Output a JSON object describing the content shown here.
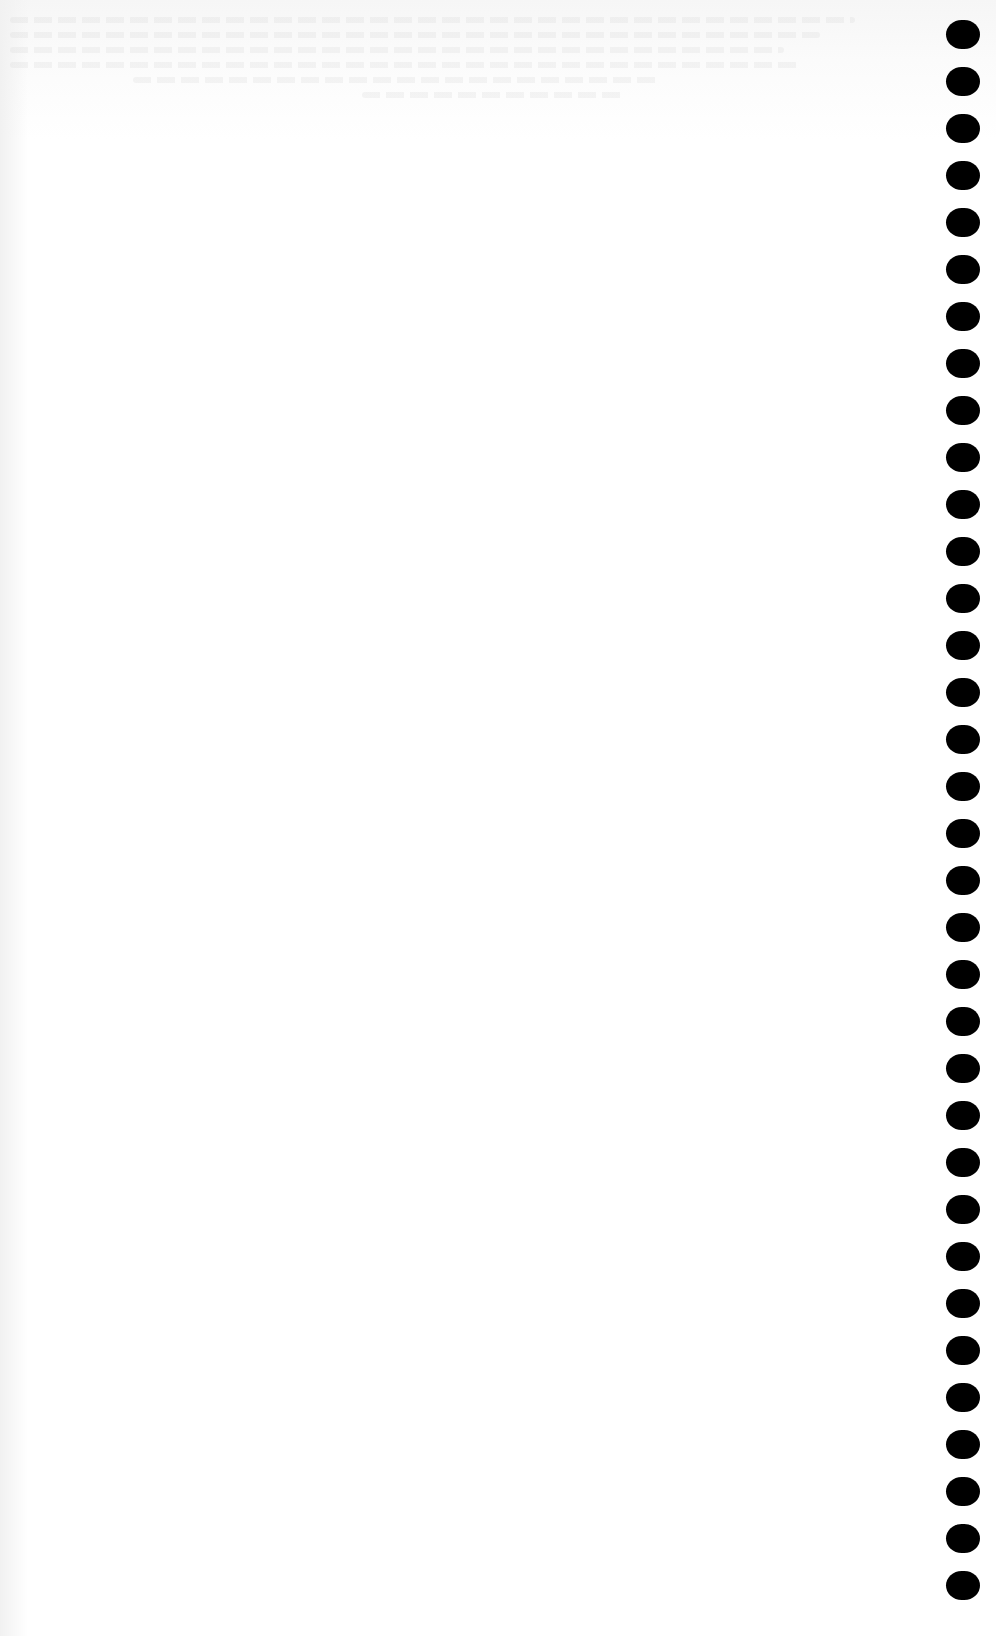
{
  "page": {
    "type": "blank-scanned-page",
    "background_color": "#ffffff",
    "content_text": ""
  },
  "bleed_through": {
    "legible": false,
    "line_count": 6
  },
  "binding": {
    "side": "right",
    "hole_count": 34,
    "hole_color": "#000000",
    "hole_spacing_px": 47,
    "hole_width_px": 34,
    "hole_height_px": 29
  }
}
